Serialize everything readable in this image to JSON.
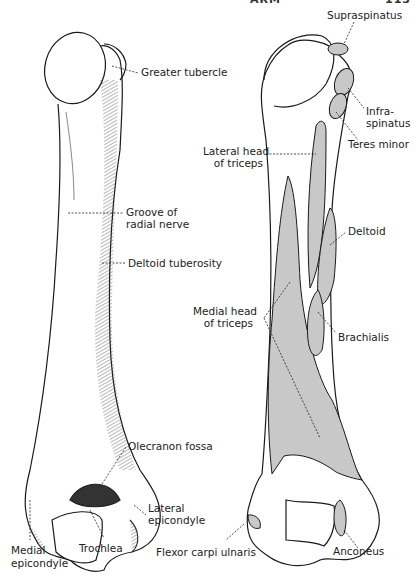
{
  "header": {
    "running_title_fragment": "ARM",
    "page_number_fragment": "113"
  },
  "figure": {
    "left_bone": {
      "view": "posterior humerus (bony landmarks)",
      "labels": [
        {
          "id": "greater-tubercle",
          "text": "Greater tubercle"
        },
        {
          "id": "groove-radial-nerve",
          "line1": "Groove of",
          "line2": "radial nerve"
        },
        {
          "id": "deltoid-tuberosity",
          "text": "Deltoid tuberosity"
        },
        {
          "id": "olecranon-fossa",
          "text": "Olecranon fossa"
        },
        {
          "id": "lateral-epicondyle",
          "line1": "Lateral",
          "line2": "epicondyle"
        },
        {
          "id": "trochlea",
          "text": "Trochlea"
        },
        {
          "id": "medial-epicondyle",
          "line1": "Medial",
          "line2": "epicondyle"
        }
      ]
    },
    "right_bone": {
      "view": "posterior humerus (muscle attachments)",
      "labels": [
        {
          "id": "supraspinatus",
          "text": "Supraspinatus"
        },
        {
          "id": "infraspinatus",
          "line1": "Infra-",
          "line2": "spinatus"
        },
        {
          "id": "teres-minor",
          "text": "Teres minor"
        },
        {
          "id": "lateral-head-triceps",
          "line1": "Lateral head",
          "line2": "of triceps"
        },
        {
          "id": "deltoid",
          "text": "Deltoid"
        },
        {
          "id": "medial-head-triceps",
          "line1": "Medial head",
          "line2": "of triceps"
        },
        {
          "id": "brachialis",
          "text": "Brachialis"
        },
        {
          "id": "flexor-carpi-ulnaris",
          "text": "Flexor carpi ulnaris"
        },
        {
          "id": "anconeus",
          "text": "Anconeus"
        }
      ]
    },
    "colors": {
      "ink": "#1a1a1a",
      "muscle_fill": "#c8c8c8",
      "background": "#ffffff"
    }
  }
}
